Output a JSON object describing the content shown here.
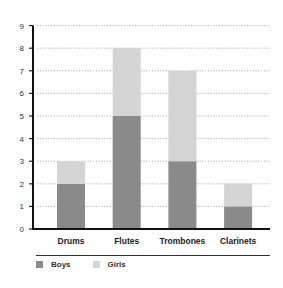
{
  "chart_data": {
    "type": "bar",
    "stacked": true,
    "title": "",
    "xlabel": "",
    "ylabel": "",
    "categories": [
      "Drums",
      "Flutes",
      "Trombones",
      "Clarinets"
    ],
    "series": [
      {
        "name": "Boys",
        "values": [
          2,
          5,
          3,
          1
        ],
        "color": "#8a8a8a"
      },
      {
        "name": "Girls",
        "values": [
          1,
          3,
          4,
          1
        ],
        "color": "#d4d4d4"
      }
    ],
    "ylim": [
      0,
      9
    ],
    "yticks": [
      0,
      1,
      2,
      3,
      4,
      5,
      6,
      7,
      8,
      9
    ],
    "grid": "horizontal-dotted",
    "legend_position": "bottom-left"
  },
  "legend": {
    "items": [
      {
        "label": "Boys",
        "color": "#8a8a8a"
      },
      {
        "label": "Girls",
        "color": "#d4d4d4"
      }
    ]
  }
}
